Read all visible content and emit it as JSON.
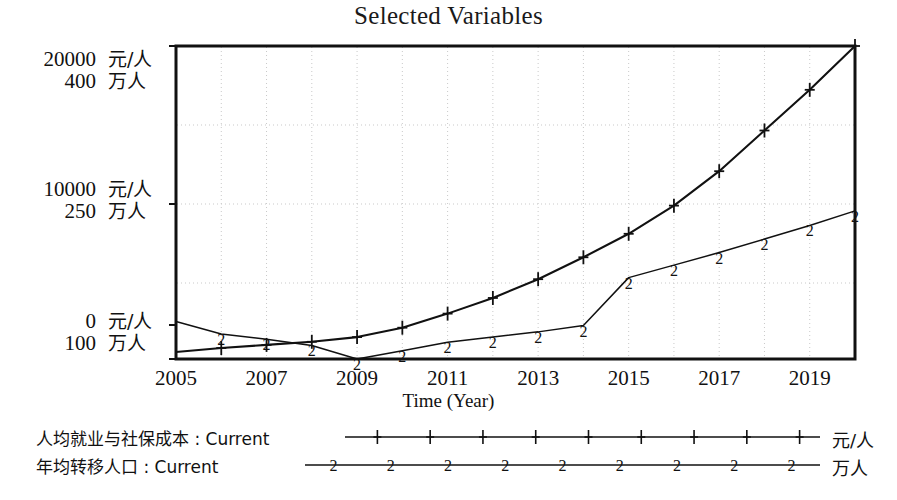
{
  "chart_data": {
    "type": "line",
    "title": "Selected Variables",
    "xlabel": "Time (Year)",
    "ylabel": "",
    "grid": true,
    "legend_position": "bottom",
    "x": [
      2005,
      2006,
      2007,
      2008,
      2009,
      2010,
      2011,
      2012,
      2013,
      2014,
      2015,
      2016,
      2017,
      2018,
      2019,
      2020
    ],
    "xtick_labels": [
      "2005",
      "2007",
      "2009",
      "2011",
      "2013",
      "2015",
      "2017",
      "2019"
    ],
    "xtick_values": [
      2005,
      2007,
      2009,
      2011,
      2013,
      2015,
      2017,
      2019
    ],
    "xlim": [
      2005,
      2020
    ],
    "axes": [
      {
        "id": "left-cost",
        "unit": "元/人",
        "ticks": [
          0,
          10000,
          20000
        ],
        "tick_labels": [
          "0",
          "10000",
          "20000"
        ],
        "ylim": [
          0,
          20000
        ]
      },
      {
        "id": "left-population",
        "unit": "万人",
        "ticks": [
          100,
          250,
          400
        ],
        "tick_labels": [
          "100",
          "250",
          "400"
        ],
        "ylim": [
          100,
          400
        ]
      }
    ],
    "series": [
      {
        "name": "人均就业与社保成本 : Current",
        "marker": "1",
        "marker_glyph": "+",
        "unit": "元/人",
        "axis": "left-cost",
        "color": "#111111",
        "values": [
          450,
          700,
          900,
          1100,
          1400,
          2000,
          2900,
          3900,
          5100,
          6500,
          8000,
          9800,
          12000,
          14600,
          17200,
          20000
        ]
      },
      {
        "name": "年均转移人口 : Current",
        "marker": "2",
        "marker_glyph": "2",
        "unit": "万人",
        "axis": "left-population",
        "color": "#111111",
        "values": [
          136,
          124,
          119,
          113,
          100,
          108,
          116,
          121,
          126,
          132,
          178,
          190,
          202,
          215,
          228,
          242
        ]
      }
    ],
    "gridlines_y_pixels": [
      125,
      204,
      283
    ],
    "plot_box": {
      "left": 176,
      "top": 46,
      "right": 855,
      "bottom": 359
    }
  },
  "ylabels": [
    {
      "num": "20000",
      "unit": "元/人",
      "top": 48
    },
    {
      "num": "400",
      "unit": "万人",
      "top": 70
    },
    {
      "num": "10000",
      "unit": "元/人",
      "top": 178
    },
    {
      "num": "250",
      "unit": "万人",
      "top": 200
    },
    {
      "num": "0",
      "unit": "元/人",
      "top": 310
    },
    {
      "num": "100",
      "unit": "万人",
      "top": 332
    }
  ],
  "legend": {
    "rows": [
      {
        "name": "人均就业与社保成本 : Current",
        "unit": "元/人",
        "marker": "+"
      },
      {
        "name": "年均转移人口 : Current",
        "unit": "万人",
        "marker": "2"
      }
    ]
  }
}
